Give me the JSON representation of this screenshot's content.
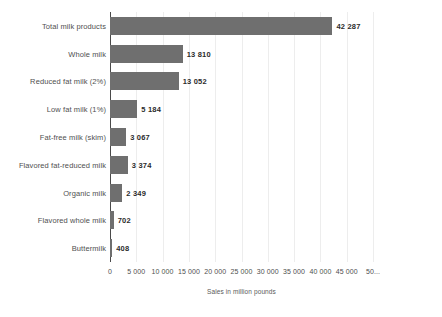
{
  "chart_data": {
    "type": "bar",
    "orientation": "horizontal",
    "title": "",
    "subtitle": "",
    "xlabel": "Sales in million pounds",
    "ylabel": "",
    "xlim": [
      0,
      50000
    ],
    "xticks": [
      0,
      5000,
      10000,
      15000,
      20000,
      25000,
      30000,
      35000,
      40000,
      45000,
      50000
    ],
    "xtick_labels": [
      "0",
      "5 000",
      "10 000",
      "15 000",
      "20 000",
      "25 000",
      "30 000",
      "35 000",
      "40 000",
      "45 000",
      "50..."
    ],
    "grid": true,
    "grid_axis": "x",
    "legend": false,
    "bar_color": "#6f6f6f",
    "categories": [
      "Total milk products",
      "Whole milk",
      "Reduced fat milk (2%)",
      "Low fat milk (1%)",
      "Fat-free milk (skim)",
      "Flavored fat-reduced milk",
      "Organic milk",
      "Flavored whole milk",
      "Buttermilk"
    ],
    "values": [
      42287,
      13810,
      13052,
      5184,
      3067,
      3374,
      2349,
      702,
      408
    ],
    "value_labels": [
      "42 287",
      "13 810",
      "13 052",
      "5 184",
      "3 067",
      "3 374",
      "2 349",
      "702",
      "408"
    ]
  }
}
